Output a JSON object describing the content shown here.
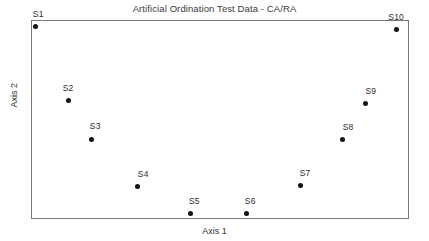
{
  "chart_data": {
    "type": "scatter",
    "title": "Artificial Ordination Test Data - CA/RA",
    "xlabel": "Axis 1",
    "ylabel": "Axis 2",
    "grid": false,
    "legend": false,
    "axis_ticks": false,
    "frame": true,
    "xlim": [
      0,
      1
    ],
    "ylim": [
      0,
      1
    ],
    "point_color": "#111111",
    "frame_color": "#7a7a7a",
    "series": [
      {
        "name": "sites",
        "points": [
          {
            "label": "S1",
            "x": 0.011,
            "y": 0.965,
            "label_dx": 0.008,
            "label_dy": 0.055
          },
          {
            "label": "S2",
            "x": 0.098,
            "y": 0.593,
            "label_dx": 0.0,
            "label_dy": 0.055
          },
          {
            "label": "S3",
            "x": 0.159,
            "y": 0.402,
            "label_dx": 0.011,
            "label_dy": 0.055
          },
          {
            "label": "S4",
            "x": 0.281,
            "y": 0.161,
            "label_dx": 0.016,
            "label_dy": 0.055
          },
          {
            "label": "S5",
            "x": 0.421,
            "y": 0.026,
            "label_dx": 0.011,
            "label_dy": 0.055
          },
          {
            "label": "S6",
            "x": 0.569,
            "y": 0.026,
            "label_dx": 0.011,
            "label_dy": 0.055
          },
          {
            "label": "S7",
            "x": 0.714,
            "y": 0.166,
            "label_dx": 0.011,
            "label_dy": 0.055
          },
          {
            "label": "S8",
            "x": 0.823,
            "y": 0.397,
            "label_dx": 0.016,
            "label_dy": 0.055
          },
          {
            "label": "S9",
            "x": 0.886,
            "y": 0.578,
            "label_dx": 0.013,
            "label_dy": 0.055
          },
          {
            "label": "S10",
            "x": 0.966,
            "y": 0.95,
            "label_dx": 0.0,
            "label_dy": 0.055
          }
        ]
      }
    ]
  }
}
